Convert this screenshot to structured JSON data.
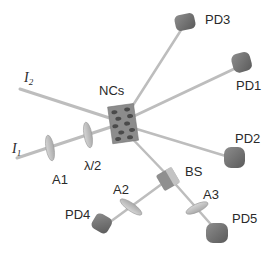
{
  "diagram": {
    "type": "optical-setup",
    "center_sample": {
      "label": "NCs"
    },
    "beams": [
      {
        "label": "I",
        "subscript": "2"
      },
      {
        "label": "I",
        "subscript": "1"
      }
    ],
    "optics": [
      {
        "id": "A1",
        "label": "A1"
      },
      {
        "id": "half-wave",
        "label": "λ/2"
      },
      {
        "id": "A2",
        "label": "A2"
      },
      {
        "id": "A3",
        "label": "A3"
      },
      {
        "id": "BS",
        "label": "BS"
      }
    ],
    "detectors": [
      {
        "id": "PD1",
        "label": "PD1"
      },
      {
        "id": "PD2",
        "label": "PD2"
      },
      {
        "id": "PD3",
        "label": "PD3"
      },
      {
        "id": "PD4",
        "label": "PD4"
      },
      {
        "id": "PD5",
        "label": "PD5"
      }
    ],
    "colors": {
      "beam": "#b8b8b8",
      "optic": "#c4c4c4",
      "detector": "#6f6f6f",
      "sample": "#8a8a8a",
      "text": "#2a2a2a"
    }
  }
}
